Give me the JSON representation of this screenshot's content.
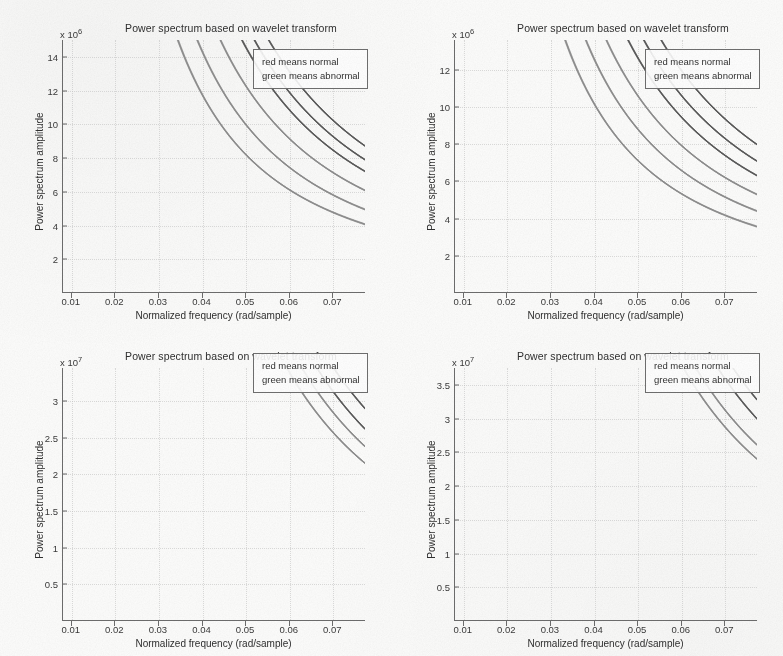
{
  "figure": {
    "layout": "2x2 subplot grid",
    "background_color": "#fdfdfc",
    "axis_color": "#6d6d6d",
    "grid_color": "#c3c3c3",
    "curve_colors": {
      "normal": "#5a5a5a",
      "abnormal": "#8d8d8d",
      "note": "original plot uses red/green; this scan is grayscale"
    }
  },
  "common": {
    "title": "Power spectrum based on wavelet transform",
    "xlabel": "Normalized frequency (rad/sample)",
    "ylabel": "Power spectrum amplitude",
    "legend": {
      "line1": "red means normal",
      "line2": "green means abnormal"
    },
    "xticks": [
      "0.01",
      "0.02",
      "0.03",
      "0.04",
      "0.05",
      "0.06",
      "0.07"
    ]
  },
  "chart_data": [
    {
      "id": "panel-top-left",
      "type": "line",
      "title": "Power spectrum based on wavelet transform",
      "xlabel": "Normalized frequency (rad/sample)",
      "ylabel": "Power spectrum amplitude",
      "exponent_label": "x 10",
      "exponent_power": "6",
      "y_scale": 1000000,
      "xlim": [
        0.008,
        0.0775
      ],
      "ylim": [
        0,
        15
      ],
      "xticks": [
        0.01,
        0.02,
        0.03,
        0.04,
        0.05,
        0.06,
        0.07
      ],
      "yticks": [
        2,
        4,
        6,
        8,
        10,
        12,
        14
      ],
      "ytick_labels": [
        "2",
        "4",
        "6",
        "8",
        "10",
        "12",
        "14"
      ],
      "grid": true,
      "legend_position": "top-right inside axes",
      "legend_entries": [
        "red means normal",
        "green means abnormal"
      ],
      "series": [
        {
          "name": "normal-upper",
          "group": "normal",
          "k": 0.138,
          "exp": 1.62,
          "x": [
            0.008,
            0.01,
            0.012,
            0.015,
            0.02,
            0.025,
            0.03,
            0.04,
            0.05,
            0.06,
            0.0775
          ],
          "values": [
            15.0,
            11.4,
            8.6,
            6.1,
            3.8,
            2.6,
            2.0,
            1.3,
            0.95,
            0.75,
            0.55
          ]
        },
        {
          "name": "normal-mid",
          "group": "normal",
          "k": 0.125,
          "exp": 1.62,
          "x": [
            0.008,
            0.01,
            0.012,
            0.015,
            0.02,
            0.025,
            0.03,
            0.04,
            0.05,
            0.06,
            0.0775
          ],
          "values": [
            14.2,
            10.4,
            7.8,
            5.5,
            3.5,
            2.4,
            1.8,
            1.2,
            0.88,
            0.7,
            0.52
          ]
        },
        {
          "name": "normal-lower",
          "group": "normal",
          "k": 0.114,
          "exp": 1.62,
          "x": [
            0.008,
            0.01,
            0.012,
            0.015,
            0.02,
            0.025,
            0.03,
            0.04,
            0.05,
            0.06,
            0.0775
          ],
          "values": [
            13.3,
            9.6,
            7.2,
            5.1,
            3.2,
            2.2,
            1.7,
            1.1,
            0.82,
            0.66,
            0.5
          ]
        },
        {
          "name": "abnormal-upper",
          "group": "abnormal",
          "k": 0.096,
          "exp": 1.62,
          "x": [
            0.008,
            0.01,
            0.012,
            0.015,
            0.02,
            0.025,
            0.03,
            0.04,
            0.05,
            0.06,
            0.0775
          ],
          "values": [
            11.0,
            8.1,
            6.1,
            4.3,
            2.7,
            1.9,
            1.45,
            0.95,
            0.72,
            0.58,
            0.44
          ]
        },
        {
          "name": "abnormal-mid",
          "group": "abnormal",
          "k": 0.078,
          "exp": 1.62,
          "x": [
            0.008,
            0.01,
            0.012,
            0.015,
            0.02,
            0.025,
            0.03,
            0.04,
            0.05,
            0.06,
            0.0775
          ],
          "values": [
            9.0,
            6.6,
            5.0,
            3.5,
            2.2,
            1.55,
            1.2,
            0.78,
            0.59,
            0.47,
            0.36
          ]
        },
        {
          "name": "abnormal-lower",
          "group": "abnormal",
          "k": 0.064,
          "exp": 1.62,
          "x": [
            0.008,
            0.01,
            0.012,
            0.015,
            0.02,
            0.025,
            0.03,
            0.04,
            0.05,
            0.06,
            0.0775
          ],
          "values": [
            7.4,
            5.4,
            4.1,
            2.9,
            1.8,
            1.27,
            0.98,
            0.64,
            0.48,
            0.39,
            0.3
          ]
        }
      ]
    },
    {
      "id": "panel-top-right",
      "type": "line",
      "title": "Power spectrum based on wavelet transform",
      "xlabel": "Normalized frequency (rad/sample)",
      "ylabel": "Power spectrum amplitude",
      "exponent_label": "x 10",
      "exponent_power": "6",
      "y_scale": 1000000,
      "xlim": [
        0.008,
        0.0775
      ],
      "ylim": [
        0,
        13.6
      ],
      "xticks": [
        0.01,
        0.02,
        0.03,
        0.04,
        0.05,
        0.06,
        0.07
      ],
      "yticks": [
        2,
        4,
        6,
        8,
        10,
        12
      ],
      "ytick_labels": [
        "2",
        "4",
        "6",
        "8",
        "10",
        "12"
      ],
      "grid": true,
      "legend_position": "top-right inside axes",
      "legend_entries": [
        "red means normal",
        "green means abnormal"
      ],
      "series": [
        {
          "name": "normal-upper",
          "group": "normal",
          "k": 0.133,
          "exp": 1.6,
          "x": [
            0.008,
            0.01,
            0.012,
            0.015,
            0.02,
            0.025,
            0.03,
            0.04,
            0.05,
            0.06,
            0.0775
          ],
          "values": [
            13.6,
            12.5,
            10.3,
            7.3,
            4.6,
            3.2,
            2.4,
            1.55,
            1.15,
            0.9,
            0.66
          ]
        },
        {
          "name": "normal-mid",
          "group": "normal",
          "k": 0.118,
          "exp": 1.6,
          "x": [
            0.008,
            0.01,
            0.012,
            0.015,
            0.02,
            0.025,
            0.03,
            0.04,
            0.05,
            0.06,
            0.0775
          ],
          "values": [
            13.6,
            11.2,
            9.2,
            6.5,
            4.1,
            2.85,
            2.2,
            1.4,
            1.05,
            0.82,
            0.6
          ]
        },
        {
          "name": "normal-lower",
          "group": "normal",
          "k": 0.105,
          "exp": 1.6,
          "x": [
            0.008,
            0.01,
            0.012,
            0.015,
            0.02,
            0.025,
            0.03,
            0.04,
            0.05,
            0.06,
            0.0775
          ],
          "values": [
            13.0,
            10.0,
            8.2,
            5.8,
            3.7,
            2.55,
            1.95,
            1.26,
            0.94,
            0.74,
            0.54
          ]
        },
        {
          "name": "abnormal-upper",
          "group": "abnormal",
          "k": 0.088,
          "exp": 1.6,
          "x": [
            0.008,
            0.01,
            0.012,
            0.015,
            0.02,
            0.025,
            0.03,
            0.04,
            0.05,
            0.06,
            0.0775
          ],
          "values": [
            11.0,
            8.4,
            6.9,
            4.9,
            3.1,
            2.15,
            1.65,
            1.06,
            0.79,
            0.62,
            0.46
          ]
        },
        {
          "name": "abnormal-mid",
          "group": "abnormal",
          "k": 0.073,
          "exp": 1.6,
          "x": [
            0.008,
            0.01,
            0.012,
            0.015,
            0.02,
            0.025,
            0.03,
            0.04,
            0.05,
            0.06,
            0.0775
          ],
          "values": [
            9.1,
            7.0,
            5.7,
            4.1,
            2.6,
            1.78,
            1.37,
            0.88,
            0.66,
            0.52,
            0.38
          ]
        },
        {
          "name": "abnormal-lower",
          "group": "abnormal",
          "k": 0.059,
          "exp": 1.6,
          "x": [
            0.008,
            0.01,
            0.012,
            0.015,
            0.02,
            0.025,
            0.03,
            0.04,
            0.05,
            0.06,
            0.0775
          ],
          "values": [
            7.4,
            5.7,
            4.6,
            3.3,
            2.1,
            1.44,
            1.11,
            0.71,
            0.53,
            0.42,
            0.31
          ]
        }
      ]
    },
    {
      "id": "panel-bottom-left",
      "type": "line",
      "title": "Power spectrum based on wavelet transform",
      "xlabel": "Normalized frequency (rad/sample)",
      "ylabel": "Power spectrum amplitude",
      "exponent_label": "x 10",
      "exponent_power": "7",
      "y_scale": 10000000,
      "xlim": [
        0.008,
        0.0775
      ],
      "ylim": [
        0,
        3.45
      ],
      "xticks": [
        0.01,
        0.02,
        0.03,
        0.04,
        0.05,
        0.06,
        0.07
      ],
      "yticks": [
        0.5,
        1,
        1.5,
        2,
        2.5,
        3
      ],
      "ytick_labels": [
        "0.5",
        "1",
        "1.5",
        "2",
        "2.5",
        "3"
      ],
      "grid": true,
      "legend_position": "top-right inside axes",
      "legend_entries": [
        "red means normal",
        "green means abnormal"
      ],
      "series": [
        {
          "name": "normal-upper",
          "group": "normal",
          "k": 0.029,
          "exp": 1.8,
          "x": [
            0.008,
            0.01,
            0.012,
            0.015,
            0.02,
            0.025,
            0.03,
            0.04,
            0.05,
            0.06,
            0.0775
          ],
          "values": [
            3.45,
            2.4,
            1.75,
            1.18,
            0.7,
            0.47,
            0.35,
            0.21,
            0.145,
            0.11,
            0.078
          ]
        },
        {
          "name": "normal-lower",
          "group": "normal",
          "k": 0.0262,
          "exp": 1.8,
          "x": [
            0.008,
            0.01,
            0.012,
            0.015,
            0.02,
            0.025,
            0.03,
            0.04,
            0.05,
            0.06,
            0.0775
          ],
          "values": [
            3.2,
            2.18,
            1.58,
            1.07,
            0.63,
            0.43,
            0.32,
            0.19,
            0.132,
            0.1,
            0.071
          ]
        },
        {
          "name": "abnormal-upper",
          "group": "abnormal",
          "k": 0.0238,
          "exp": 1.8,
          "x": [
            0.008,
            0.01,
            0.012,
            0.015,
            0.02,
            0.025,
            0.03,
            0.04,
            0.05,
            0.06,
            0.0775
          ],
          "values": [
            2.95,
            1.98,
            1.44,
            0.97,
            0.57,
            0.39,
            0.29,
            0.175,
            0.12,
            0.092,
            0.065
          ]
        },
        {
          "name": "abnormal-lower",
          "group": "abnormal",
          "k": 0.0215,
          "exp": 1.8,
          "x": [
            0.008,
            0.01,
            0.012,
            0.015,
            0.02,
            0.025,
            0.03,
            0.04,
            0.05,
            0.06,
            0.0775
          ],
          "values": [
            2.7,
            1.79,
            1.3,
            0.88,
            0.52,
            0.35,
            0.26,
            0.158,
            0.108,
            0.083,
            0.059
          ]
        }
      ]
    },
    {
      "id": "panel-bottom-right",
      "type": "line",
      "title": "Power spectrum based on wavelet transform",
      "xlabel": "Normalized frequency (rad/sample)",
      "ylabel": "Power spectrum amplitude",
      "exponent_label": "x 10",
      "exponent_power": "7",
      "y_scale": 10000000,
      "xlim": [
        0.008,
        0.0775
      ],
      "ylim": [
        0,
        3.75
      ],
      "xticks": [
        0.01,
        0.02,
        0.03,
        0.04,
        0.05,
        0.06,
        0.07
      ],
      "yticks": [
        0.5,
        1,
        1.5,
        2,
        2.5,
        3,
        3.5
      ],
      "ytick_labels": [
        "0.5",
        "1",
        "1.5",
        "2",
        "2.5",
        "3",
        "3.5"
      ],
      "grid": true,
      "legend_position": "top-right inside axes",
      "legend_entries": [
        "red means normal",
        "green means abnormal"
      ],
      "series": [
        {
          "name": "normal-upper",
          "group": "normal",
          "k": 0.0312,
          "exp": 1.82,
          "x": [
            0.008,
            0.01,
            0.012,
            0.015,
            0.02,
            0.025,
            0.03,
            0.04,
            0.05,
            0.06,
            0.0775
          ],
          "values": [
            3.7,
            2.55,
            1.84,
            1.23,
            0.72,
            0.48,
            0.35,
            0.21,
            0.145,
            0.108,
            0.076
          ]
        },
        {
          "name": "normal-lower",
          "group": "normal",
          "k": 0.0285,
          "exp": 1.82,
          "x": [
            0.008,
            0.01,
            0.012,
            0.015,
            0.02,
            0.025,
            0.03,
            0.04,
            0.05,
            0.06,
            0.0775
          ],
          "values": [
            3.38,
            2.33,
            1.68,
            1.12,
            0.66,
            0.44,
            0.32,
            0.19,
            0.133,
            0.099,
            0.07
          ]
        },
        {
          "name": "abnormal-upper",
          "group": "abnormal",
          "k": 0.0248,
          "exp": 1.82,
          "x": [
            0.008,
            0.01,
            0.012,
            0.015,
            0.02,
            0.025,
            0.03,
            0.04,
            0.05,
            0.06,
            0.0775
          ],
          "values": [
            2.94,
            2.02,
            1.46,
            0.98,
            0.57,
            0.38,
            0.28,
            0.166,
            0.115,
            0.086,
            0.061
          ]
        },
        {
          "name": "abnormal-lower",
          "group": "abnormal",
          "k": 0.0228,
          "exp": 1.82,
          "x": [
            0.008,
            0.01,
            0.012,
            0.015,
            0.02,
            0.025,
            0.03,
            0.04,
            0.05,
            0.06,
            0.0775
          ],
          "values": [
            2.7,
            1.86,
            1.34,
            0.9,
            0.53,
            0.35,
            0.26,
            0.153,
            0.106,
            0.079,
            0.056
          ]
        }
      ]
    }
  ]
}
